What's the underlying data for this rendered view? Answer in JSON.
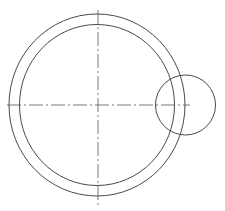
{
  "diagram": {
    "type": "technical-drawing",
    "stroke_color": "#4a4a4a",
    "centerline_color": "#555555",
    "background": "#ffffff",
    "main_center": {
      "cx": 97,
      "cy": 105
    },
    "outer_ring": {
      "rx": 88,
      "ry": 91
    },
    "inner_ring": {
      "rx": 77.5,
      "ry": 80.5
    },
    "small_circle": {
      "cx": 185.5,
      "cy": 105,
      "r": 30
    },
    "horizontal_centerline": {
      "x1": 7,
      "x2": 190,
      "y": 105
    },
    "vertical_centerline": {
      "x": 98,
      "y1": 10,
      "y2": 207
    }
  }
}
